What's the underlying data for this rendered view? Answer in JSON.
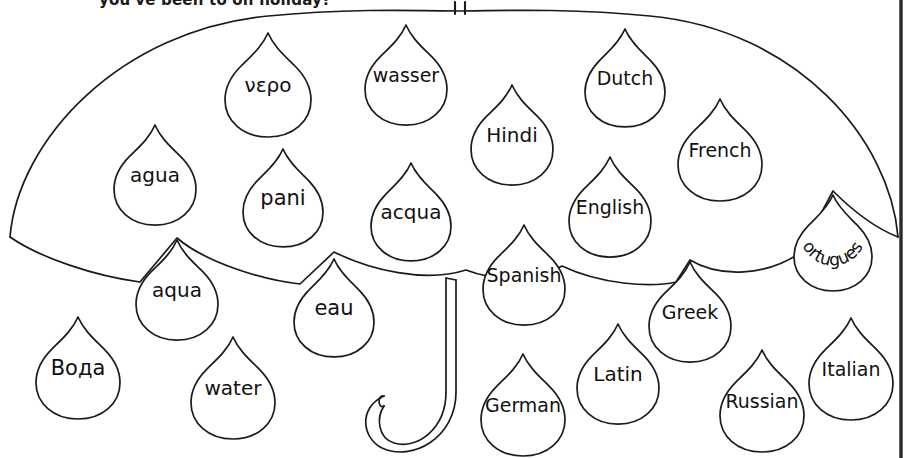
{
  "worksheet": {
    "header_text": "you've been to on holiday?",
    "title": "Water words umbrella worksheet",
    "ink_color": "#1b1b1b",
    "paper_color": "#ffffff",
    "border_color": "#2b2b2b"
  },
  "umbrella": {
    "name": "umbrella",
    "parts": {
      "canopy": "umbrella-canopy",
      "ferrule": "umbrella-ferrule-tip",
      "shaft": "umbrella-shaft",
      "handle": "umbrella-j-handle"
    }
  },
  "raindrops": [
    {
      "id": "drop-vero",
      "label": "νερο",
      "cx": 268,
      "cy": 85,
      "w": 86,
      "h": 104,
      "font": 20,
      "rot": 0,
      "style": "greek",
      "region": "canopy"
    },
    {
      "id": "drop-wasser",
      "label": "wasser",
      "cx": 406,
      "cy": 75,
      "w": 82,
      "h": 100,
      "font": 19,
      "rot": 0,
      "style": "plain",
      "region": "canopy"
    },
    {
      "id": "drop-dutch",
      "label": "Dutch",
      "cx": 625,
      "cy": 78,
      "w": 80,
      "h": 98,
      "font": 19,
      "rot": 0,
      "style": "plain",
      "region": "canopy"
    },
    {
      "id": "drop-hindi",
      "label": "Hindi",
      "cx": 512,
      "cy": 135,
      "w": 82,
      "h": 100,
      "font": 20,
      "rot": 0,
      "style": "plain",
      "region": "canopy"
    },
    {
      "id": "drop-french",
      "label": "French",
      "cx": 720,
      "cy": 150,
      "w": 84,
      "h": 102,
      "font": 19,
      "rot": 0,
      "style": "plain",
      "region": "canopy"
    },
    {
      "id": "drop-agua-es",
      "label": "agua",
      "cx": 155,
      "cy": 175,
      "w": 82,
      "h": 100,
      "font": 20,
      "rot": 0,
      "style": "plain",
      "region": "canopy"
    },
    {
      "id": "drop-pani",
      "label": "pani",
      "cx": 283,
      "cy": 198,
      "w": 80,
      "h": 98,
      "font": 21,
      "rot": 0,
      "style": "plain",
      "region": "canopy"
    },
    {
      "id": "drop-acqua",
      "label": "acqua",
      "cx": 411,
      "cy": 212,
      "w": 80,
      "h": 98,
      "font": 20,
      "rot": 0,
      "style": "plain",
      "region": "canopy"
    },
    {
      "id": "drop-english",
      "label": "English",
      "cx": 610,
      "cy": 207,
      "w": 82,
      "h": 100,
      "font": 19,
      "rot": 0,
      "style": "plain",
      "region": "canopy"
    },
    {
      "id": "drop-portuguese",
      "label": "Portuguese",
      "cx": 833,
      "cy": 243,
      "w": 78,
      "h": 96,
      "font": 17,
      "rot": 0,
      "style": "arc",
      "region": "canopy-edge"
    },
    {
      "id": "drop-aqua-la",
      "label": "aqua",
      "cx": 177,
      "cy": 290,
      "w": 82,
      "h": 100,
      "font": 20,
      "rot": 0,
      "style": "plain",
      "region": "edge"
    },
    {
      "id": "drop-eau",
      "label": "eau",
      "cx": 334,
      "cy": 308,
      "w": 80,
      "h": 98,
      "font": 21,
      "rot": 0,
      "style": "plain",
      "region": "edge"
    },
    {
      "id": "drop-spanish",
      "label": "Spanish",
      "cx": 524,
      "cy": 275,
      "w": 82,
      "h": 100,
      "font": 19,
      "rot": 0,
      "style": "plain",
      "region": "edge"
    },
    {
      "id": "drop-greek",
      "label": "Greek",
      "cx": 690,
      "cy": 312,
      "w": 82,
      "h": 100,
      "font": 19,
      "rot": 0,
      "style": "plain",
      "region": "edge"
    },
    {
      "id": "drop-voda",
      "label": "Вода",
      "cx": 78,
      "cy": 368,
      "w": 84,
      "h": 102,
      "font": 21,
      "rot": 0,
      "style": "cyr",
      "region": "falling"
    },
    {
      "id": "drop-water",
      "label": "water",
      "cx": 233,
      "cy": 388,
      "w": 84,
      "h": 102,
      "font": 20,
      "rot": 0,
      "style": "plain",
      "region": "falling"
    },
    {
      "id": "drop-german",
      "label": "German",
      "cx": 523,
      "cy": 405,
      "w": 84,
      "h": 102,
      "font": 19,
      "rot": 0,
      "style": "plain",
      "region": "falling"
    },
    {
      "id": "drop-latin",
      "label": "Latin",
      "cx": 618,
      "cy": 374,
      "w": 82,
      "h": 100,
      "font": 20,
      "rot": 0,
      "style": "plain",
      "region": "falling"
    },
    {
      "id": "drop-russian",
      "label": "Russian",
      "cx": 762,
      "cy": 401,
      "w": 84,
      "h": 102,
      "font": 19,
      "rot": 0,
      "style": "plain",
      "region": "falling"
    },
    {
      "id": "drop-italian",
      "label": "Italian",
      "cx": 851,
      "cy": 369,
      "w": 84,
      "h": 102,
      "font": 19,
      "rot": 0,
      "style": "plain",
      "region": "falling"
    }
  ]
}
